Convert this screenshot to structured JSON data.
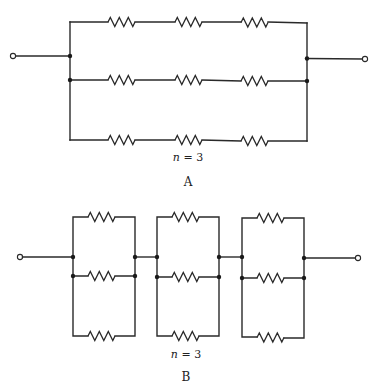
{
  "figure": {
    "background": "#ffffff",
    "line_color": "#2a2a2a"
  },
  "diagram_a": {
    "caption": "A",
    "n_label_var": "n",
    "n_label_rest": " = 3",
    "topology": "series-parallel: 3 parallel branches, each with 3 series resistors",
    "branches": 3,
    "resistors_per_branch": 3,
    "left_bus_x": 70,
    "right_bus_x": 307,
    "branch_y": [
      22,
      80,
      140
    ],
    "input_terminal": {
      "x": 13,
      "y": 56
    },
    "output_terminal": {
      "x": 365,
      "y": 59
    },
    "left_junctions_y": [
      56,
      80
    ],
    "right_junctions_y": [
      58,
      81
    ],
    "resistor_x": [
      108,
      175,
      241
    ]
  },
  "diagram_b": {
    "caption": "B",
    "n_label_var": "n",
    "n_label_rest": " = 3",
    "topology": "parallel-series: 3 series blocks, each with 3 parallel resistors",
    "blocks": [
      {
        "left_x": 73,
        "right_x": 135
      },
      {
        "left_x": 157,
        "right_x": 219
      },
      {
        "left_x": 242,
        "right_x": 304
      }
    ],
    "branch_y": [
      217,
      276,
      336
    ],
    "link_y": 257,
    "input_terminal": {
      "x": 20,
      "y": 257
    },
    "output_terminal": {
      "x": 358,
      "y": 258
    }
  }
}
